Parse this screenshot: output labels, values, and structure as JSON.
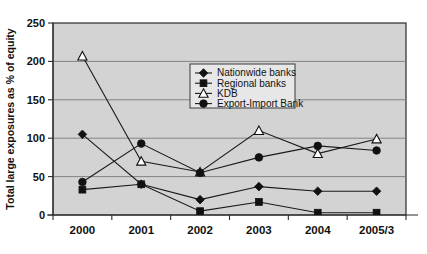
{
  "chart_data": {
    "type": "line",
    "title": "",
    "xlabel": "",
    "ylabel": "Total large exposures as % of equity",
    "categories": [
      "2000",
      "2001",
      "2002",
      "2003",
      "2004",
      "2005/3"
    ],
    "ylim": [
      0,
      250
    ],
    "ytick_labels": [
      "0",
      "50",
      "100",
      "150",
      "200",
      "250"
    ],
    "ytick_values": [
      0,
      50,
      100,
      150,
      200,
      250
    ],
    "grid": true,
    "legend_position": "upper-center",
    "series": [
      {
        "name": "Nationwide banks",
        "marker": "diamond-filled",
        "values": [
          105,
          40,
          20,
          37,
          31,
          31
        ]
      },
      {
        "name": "Regional banks",
        "marker": "square-filled",
        "values": [
          33,
          40,
          5,
          17,
          3,
          3
        ]
      },
      {
        "name": "KDB",
        "marker": "triangle-open",
        "values": [
          207,
          70,
          56,
          110,
          80,
          99
        ]
      },
      {
        "name": "Export-Import Bank",
        "marker": "circle-filled",
        "values": [
          43,
          93,
          55,
          75,
          90,
          84
        ]
      }
    ]
  },
  "axis": {
    "y_title": "Total large exposures as % of equity",
    "y_ticks": [
      "250",
      "200",
      "150",
      "100",
      "50",
      "0"
    ],
    "x_ticks": [
      "2000",
      "2001",
      "2002",
      "2003",
      "2004",
      "2005/3"
    ]
  },
  "legend": {
    "entries": [
      {
        "label": "Nationwide banks",
        "marker": "diamond-filled"
      },
      {
        "label": "Regional banks",
        "marker": "square-filled"
      },
      {
        "label": "KDB",
        "marker": "triangle-open"
      },
      {
        "label": "Export-Import Bank",
        "marker": "circle-filled"
      }
    ]
  },
  "colors": {
    "plot_background": "#d3d3d3",
    "page_background": "#ffffff",
    "line": "#1a1a1a",
    "gridline": "#7a7a7a",
    "axis": "#2b2b2b",
    "legend_background": "#e7e7e7"
  }
}
